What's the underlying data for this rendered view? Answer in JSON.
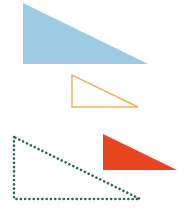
{
  "diagram": {
    "shapes": [
      {
        "id": "blue-triangle",
        "style": "filled",
        "color": "#9ccbe3",
        "points": [
          [
            23,
            3
          ],
          [
            23,
            64
          ],
          [
            148,
            64
          ]
        ]
      },
      {
        "id": "orange-triangle",
        "style": "outline",
        "color": "#e8b35c",
        "points": [
          [
            72,
            75
          ],
          [
            72,
            107
          ],
          [
            138,
            107
          ]
        ]
      },
      {
        "id": "green-triangle",
        "style": "dotted-outline",
        "color": "#2e6a4a",
        "points": [
          [
            14,
            137
          ],
          [
            14,
            199
          ],
          [
            140,
            199
          ]
        ]
      },
      {
        "id": "red-triangle",
        "style": "filled",
        "color": "#e8441f",
        "points": [
          [
            103,
            134
          ],
          [
            103,
            170
          ],
          [
            177,
            170
          ]
        ]
      }
    ]
  }
}
